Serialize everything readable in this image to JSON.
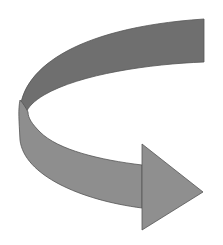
{
  "figure": {
    "type": "curved-ribbon-arrow",
    "direction": "right",
    "colors": {
      "background": "#ffffff",
      "back_band": "#6f6f6f",
      "front_band": "#8e8e8e",
      "arrow_head": "#8f8f8f",
      "outline": "#555555"
    }
  }
}
